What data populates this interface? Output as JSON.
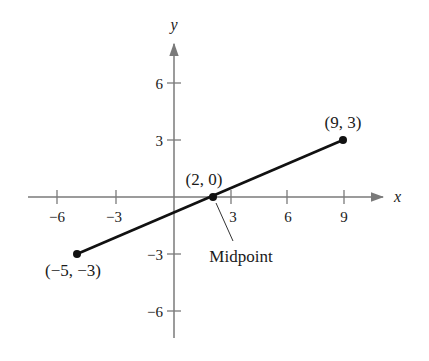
{
  "figure": {
    "type": "coordinate-plane"
  },
  "axes": {
    "x_label": "x",
    "y_label": "y",
    "x_ticks": [
      "−6",
      "−3",
      "3",
      "6",
      "9"
    ],
    "y_ticks": [
      "6",
      "3",
      "−3",
      "−6"
    ],
    "axis_color": "#7a7a7a"
  },
  "points": [
    {
      "id": "endpoint-a",
      "label": "(−5, −3)",
      "x": -5,
      "y": -3
    },
    {
      "id": "midpoint",
      "label": "(2, 0)",
      "x": 2,
      "y": 0
    },
    {
      "id": "endpoint-b",
      "label": "(9, 3)",
      "x": 9,
      "y": 3
    }
  ],
  "annotation": {
    "midpoint_callout": "Midpoint"
  },
  "segment_color": "#111111"
}
